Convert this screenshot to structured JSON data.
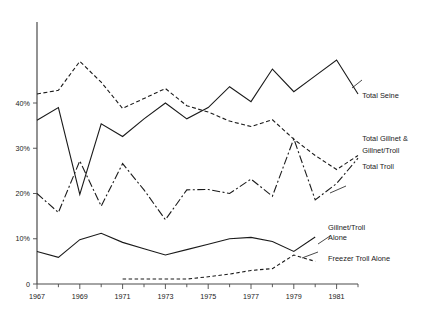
{
  "chart_data": {
    "type": "line",
    "title": "",
    "subtitle": "",
    "xlabel": "",
    "ylabel": "",
    "xlim": [
      1967,
      1982
    ],
    "ylim": [
      0,
      52
    ],
    "grid": false,
    "legend_position": "right-inline",
    "x": [
      1967,
      1968,
      1969,
      1970,
      1971,
      1972,
      1973,
      1974,
      1975,
      1976,
      1977,
      1978,
      1979,
      1980,
      1981,
      1982
    ],
    "xticks_major": [
      1967,
      1969,
      1971,
      1973,
      1975,
      1977,
      1979,
      1981
    ],
    "xtick_labels": [
      "1967",
      "1969",
      "1971",
      "1973",
      "1975",
      "1977",
      "1979",
      "1981"
    ],
    "xticks_minor": [
      1968,
      1970,
      1972,
      1974,
      1976,
      1978,
      1980,
      1982
    ],
    "yticks": [
      0,
      10,
      20,
      30,
      40
    ],
    "ytick_labels": [
      "0",
      "10%",
      "20%",
      "30%",
      "40%"
    ],
    "series": [
      {
        "name": "Total Seine",
        "label": "Total Seine",
        "style": "dashed-then-solid",
        "dash": "4,2.5",
        "color": "#1a1a1a",
        "values": [
          42.0,
          42.8,
          49.2,
          44.6,
          38.8,
          41.0,
          43.2,
          39.4,
          38.0,
          36.0,
          34.8,
          36.3,
          32.0,
          28.4,
          25.3,
          28.4
        ]
      },
      {
        "name": "Total Gillnet & Gillnet/Troll",
        "label_line1": "Total Gillnet &",
        "label_line2": "Gillnet/Troll",
        "style": "solid",
        "dash": "none",
        "color": "#1a1a1a",
        "values": [
          36.2,
          39.0,
          19.8,
          35.4,
          32.6,
          36.5,
          40.0,
          36.5,
          39.0,
          43.6,
          40.3,
          47.5,
          42.5,
          46.0,
          49.5,
          42.0
        ]
      },
      {
        "name": "Total Troll",
        "label": "Total Troll",
        "style": "dash-dot",
        "dash": "8,2.5,2,2.5",
        "color": "#1a1a1a",
        "values": [
          20.0,
          15.8,
          27.2,
          17.2,
          26.6,
          20.8,
          14.2,
          20.8,
          20.9,
          20.0,
          23.2,
          19.4,
          32.1,
          18.6,
          22.2,
          27.8
        ]
      },
      {
        "name": "Gillnet/Troll Alone",
        "label_line1": "Gillnet/Troll",
        "label_line2": "Alone",
        "style": "solid",
        "dash": "none",
        "color": "#1a1a1a",
        "values": [
          7.2,
          5.9,
          9.8,
          11.2,
          9.2,
          7.8,
          6.4,
          7.6,
          8.8,
          10.0,
          10.3,
          9.4,
          7.2,
          10.4,
          null,
          null
        ]
      },
      {
        "name": "Freezer Troll Alone",
        "label": "Freezer Troll Alone",
        "style": "dashed",
        "dash": "3.5,2.5",
        "color": "#1a1a1a",
        "values": [
          null,
          null,
          null,
          null,
          1.1,
          1.1,
          1.1,
          1.1,
          1.6,
          2.2,
          3.0,
          3.4,
          6.4,
          5.0,
          null,
          null
        ]
      }
    ],
    "annotations": [
      {
        "text": "Total Seine",
        "x": 1982.2,
        "y": 41.0
      },
      {
        "text": "Total Gillnet &",
        "x": 1982.2,
        "y": 31.6
      },
      {
        "text": "Gillnet/Troll",
        "x": 1982.2,
        "y": 29.0
      },
      {
        "text": "Total Troll",
        "x": 1982.2,
        "y": 25.4
      },
      {
        "text": "Gillnet/Troll",
        "x": 1980.6,
        "y": 12.0
      },
      {
        "text": "Alone",
        "x": 1980.6,
        "y": 9.8
      },
      {
        "text": "Freezer Troll Alone",
        "x": 1980.6,
        "y": 5.0
      }
    ]
  }
}
